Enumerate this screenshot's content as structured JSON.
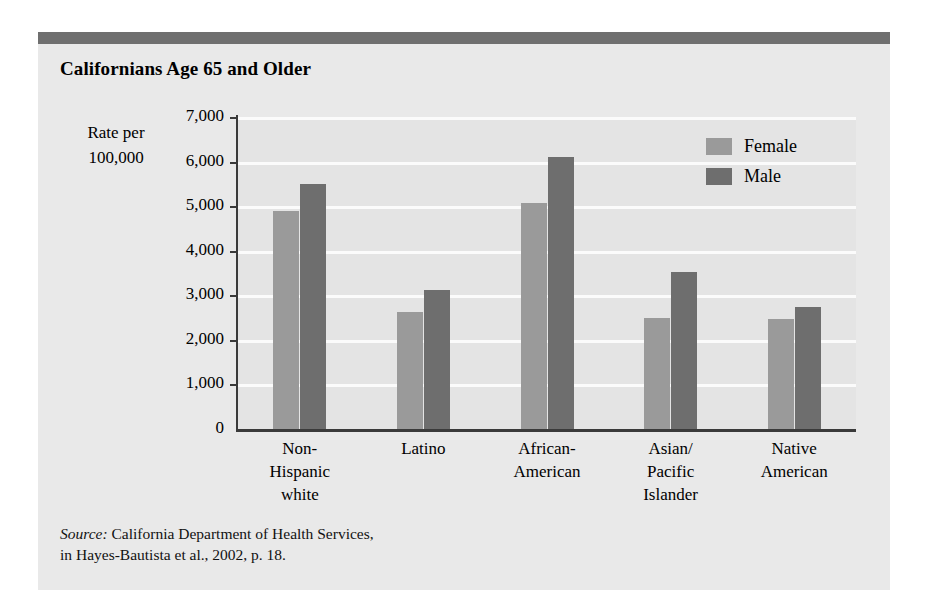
{
  "figure": {
    "title": "Californians Age 65 and Older",
    "axis_caption_line1": "Rate per",
    "axis_caption_line2": "100,000",
    "source_label": "Source:",
    "source_line1": " California Department of Health Services,",
    "source_line2": "in Hayes-Bautista et al., 2002, p. 18.",
    "header_rule_color": "#6f6f6f",
    "panel_color": "#e9e9e9",
    "plot_bg_color": "#e4e4e4",
    "gridline_color": "#fbfbfb",
    "axis_color": "#3a3a3a"
  },
  "chart_data": {
    "type": "bar",
    "title": "Californians Age 65 and Older",
    "xlabel": "",
    "ylabel": "Rate per 100,000",
    "ylim": [
      0,
      7000
    ],
    "ytick_labels": [
      "7,000",
      "6,000",
      "5,000",
      "4,000",
      "3,000",
      "2,000",
      "1,000",
      "0"
    ],
    "ytick_values": [
      7000,
      6000,
      5000,
      4000,
      3000,
      2000,
      1000,
      0
    ],
    "grid": true,
    "legend_position": "top-right",
    "categories": [
      "Non-Hispanic white",
      "Latino",
      "African-American",
      "Asian/Pacific Islander",
      "Native American"
    ],
    "category_label_lines": [
      [
        "Non-",
        "Hispanic",
        "white"
      ],
      [
        "Latino"
      ],
      [
        "African-",
        "American"
      ],
      [
        "Asian/",
        "Pacific",
        "Islander"
      ],
      [
        "Native",
        "American"
      ]
    ],
    "series": [
      {
        "name": "Female",
        "color": "#9a9a9a",
        "values": [
          4900,
          2620,
          5080,
          2480,
          2460
        ]
      },
      {
        "name": "Male",
        "color": "#6e6e6e",
        "values": [
          5500,
          3110,
          6100,
          3530,
          2730
        ]
      }
    ]
  }
}
